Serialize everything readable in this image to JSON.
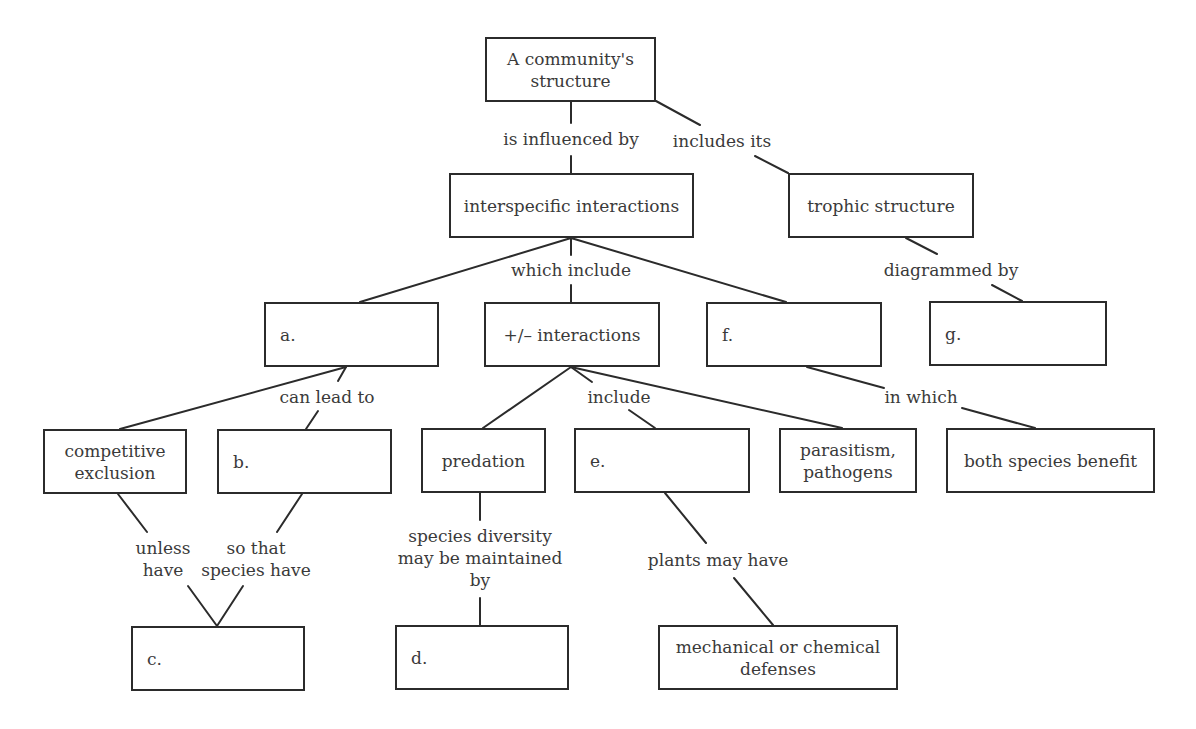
{
  "diagram": {
    "colors": {
      "stroke": "#2b2b2b",
      "text": "#3a3a3a",
      "background": "#ffffff"
    },
    "nodes": [
      {
        "id": "community-structure",
        "text": "A community's\nstructure",
        "x": 485,
        "y": 37,
        "w": 171,
        "h": 65,
        "align": "center"
      },
      {
        "id": "interspecific-interactions",
        "text": "interspecific interactions",
        "x": 449,
        "y": 173,
        "w": 245,
        "h": 65,
        "align": "center"
      },
      {
        "id": "trophic-structure",
        "text": "trophic structure",
        "x": 788,
        "y": 173,
        "w": 186,
        "h": 65,
        "align": "center"
      },
      {
        "id": "blank-a",
        "text": "a.",
        "x": 264,
        "y": 302,
        "w": 175,
        "h": 65,
        "align": "left"
      },
      {
        "id": "plus-minus-interactions",
        "text": "+/– interactions",
        "x": 484,
        "y": 302,
        "w": 176,
        "h": 65,
        "align": "center"
      },
      {
        "id": "blank-f",
        "text": "f.",
        "x": 706,
        "y": 302,
        "w": 176,
        "h": 65,
        "align": "left"
      },
      {
        "id": "blank-g",
        "text": "g.",
        "x": 929,
        "y": 301,
        "w": 178,
        "h": 65,
        "align": "left"
      },
      {
        "id": "competitive-exclusion",
        "text": "competitive\nexclusion",
        "x": 43,
        "y": 429,
        "w": 144,
        "h": 65,
        "align": "center"
      },
      {
        "id": "blank-b",
        "text": "b.",
        "x": 217,
        "y": 429,
        "w": 175,
        "h": 65,
        "align": "left"
      },
      {
        "id": "predation",
        "text": "predation",
        "x": 421,
        "y": 428,
        "w": 125,
        "h": 65,
        "align": "center"
      },
      {
        "id": "blank-e",
        "text": "e.",
        "x": 574,
        "y": 428,
        "w": 176,
        "h": 65,
        "align": "left"
      },
      {
        "id": "parasitism-pathogens",
        "text": "parasitism,\npathogens",
        "x": 779,
        "y": 428,
        "w": 138,
        "h": 65,
        "align": "center"
      },
      {
        "id": "both-species-benefit",
        "text": "both species benefit",
        "x": 946,
        "y": 428,
        "w": 209,
        "h": 65,
        "align": "center"
      },
      {
        "id": "blank-c",
        "text": "c.",
        "x": 131,
        "y": 626,
        "w": 174,
        "h": 65,
        "align": "left"
      },
      {
        "id": "blank-d",
        "text": "d.",
        "x": 395,
        "y": 625,
        "w": 174,
        "h": 65,
        "align": "left"
      },
      {
        "id": "mechanical-chemical-defenses",
        "text": "mechanical or chemical\ndefenses",
        "x": 658,
        "y": 625,
        "w": 240,
        "h": 65,
        "align": "center"
      }
    ],
    "edge_labels": [
      {
        "id": "is-influenced-by",
        "text": "is influenced by",
        "x": 571,
        "y": 139
      },
      {
        "id": "includes-its",
        "text": "includes its",
        "x": 722,
        "y": 141
      },
      {
        "id": "which-include",
        "text": "which include",
        "x": 571,
        "y": 270
      },
      {
        "id": "diagrammed-by",
        "text": "diagrammed by",
        "x": 951,
        "y": 270
      },
      {
        "id": "can-lead-to",
        "text": "can lead to",
        "x": 327,
        "y": 397
      },
      {
        "id": "include",
        "text": "include",
        "x": 619,
        "y": 397
      },
      {
        "id": "in-which",
        "text": "in which",
        "x": 921,
        "y": 397
      },
      {
        "id": "unless-have",
        "text": "unless\nhave",
        "x": 163,
        "y": 559
      },
      {
        "id": "so-that-species-have",
        "text": "so that\nspecies have",
        "x": 256,
        "y": 559
      },
      {
        "id": "species-diversity-maintained-by",
        "text": "species diversity\nmay be maintained\nby",
        "x": 480,
        "y": 558
      },
      {
        "id": "plants-may-have",
        "text": "plants may have",
        "x": 718,
        "y": 560
      }
    ],
    "edges": [
      [
        571,
        102,
        571,
        123
      ],
      [
        571,
        156,
        571,
        173
      ],
      [
        656,
        101,
        700,
        125
      ],
      [
        755,
        156,
        788,
        173
      ],
      [
        571,
        238,
        571,
        255
      ],
      [
        571,
        285,
        571,
        302
      ],
      [
        571,
        238,
        360,
        302
      ],
      [
        571,
        238,
        786,
        302
      ],
      [
        906,
        238,
        937,
        254
      ],
      [
        992,
        285,
        1022,
        301
      ],
      [
        346,
        367,
        120,
        429
      ],
      [
        346,
        367,
        338,
        381
      ],
      [
        318,
        411,
        306,
        429
      ],
      [
        571,
        367,
        483,
        428
      ],
      [
        571,
        367,
        592,
        382
      ],
      [
        629,
        410,
        655,
        428
      ],
      [
        571,
        367,
        842,
        428
      ],
      [
        807,
        367,
        884,
        388
      ],
      [
        962,
        408,
        1035,
        428
      ],
      [
        118,
        494,
        147,
        532
      ],
      [
        302,
        494,
        277,
        532
      ],
      [
        188,
        586,
        217,
        626
      ],
      [
        243,
        586,
        217,
        626
      ],
      [
        480,
        493,
        480,
        520
      ],
      [
        480,
        598,
        480,
        625
      ],
      [
        665,
        493,
        706,
        543
      ],
      [
        734,
        578,
        773,
        625
      ]
    ]
  }
}
